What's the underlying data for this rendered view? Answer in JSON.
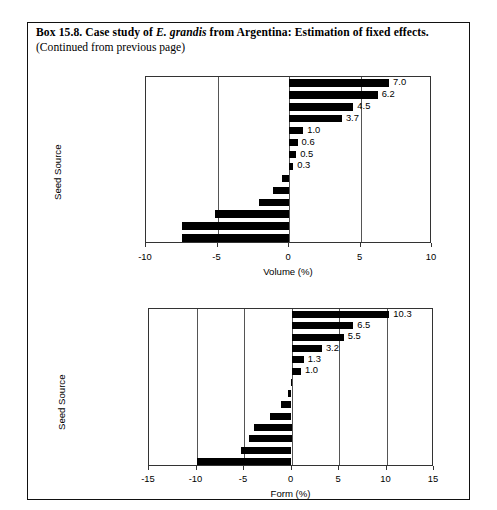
{
  "box": {
    "title_parts": {
      "before": "Box 15.8. Case study of ",
      "italic": "E. grandis",
      "after": " from Argentina: Estimation of fixed effects."
    },
    "title_full": "Box 15.8. Case study of E. grandis from Argentina: Estimation of fixed effects.",
    "subtitle": "(Continued from previous page)"
  },
  "chart_data": [
    {
      "id": "volume",
      "type": "bar",
      "orientation": "horizontal",
      "title": "",
      "xlabel": "Volume (%)",
      "ylabel": "Seed Source",
      "xlim": [
        -10,
        10
      ],
      "xticks": [
        -10,
        -5,
        0,
        5,
        10
      ],
      "xtick_labels": [
        "-10",
        "-5",
        "0",
        "5",
        "10"
      ],
      "grid": true,
      "gridlines_at": [
        -5,
        0,
        5
      ],
      "legend": null,
      "categories": [
        "N10",
        "N04",
        "N08",
        "N02",
        "N01",
        "Selected",
        "N12",
        "N11",
        "N03",
        "N05",
        "N06",
        "N07",
        "N09",
        "Unselected"
      ],
      "values": [
        7.0,
        6.2,
        4.5,
        3.7,
        1.0,
        0.6,
        0.5,
        0.3,
        -0.5,
        -1.1,
        -2.1,
        -5.2,
        -7.5,
        -7.5
      ],
      "value_labels": [
        "7.0",
        "6.2",
        "4.5",
        "3.7",
        "1.0",
        "0.6",
        "0.5",
        "0.3",
        "-0.5",
        "-1.1",
        "-2.1",
        "-5.2",
        "-7.5",
        "-7.5"
      ]
    },
    {
      "id": "form",
      "type": "bar",
      "orientation": "horizontal",
      "title": "",
      "xlabel": "Form (%)",
      "ylabel": "Seed Source",
      "xlim": [
        -15,
        15
      ],
      "xticks": [
        -15,
        -10,
        -5,
        0,
        5,
        10,
        15
      ],
      "xtick_labels": [
        "-15",
        "-10",
        "-5",
        "0",
        "5",
        "10",
        "15"
      ],
      "grid": true,
      "gridlines_at": [
        -10,
        -5,
        0,
        5,
        10
      ],
      "legend": null,
      "categories": [
        "N11",
        "N03",
        "N10",
        "N09",
        "N08",
        "N04",
        "Selected",
        "N05",
        "N01",
        "N06",
        "N02",
        "N12",
        "N07",
        "Unselected"
      ],
      "values": [
        10.3,
        6.5,
        5.5,
        3.2,
        1.3,
        1.0,
        -0.1,
        -0.4,
        -1.1,
        -2.3,
        -4.0,
        -4.5,
        -5.3,
        -9.9
      ],
      "value_labels": [
        "10.3",
        "6.5",
        "5.5",
        "3.2",
        "1.3",
        "1.0",
        "-0.1",
        "-0.4",
        "-1.1",
        "-2.3",
        "-4.0",
        "-4.5",
        "-5.3",
        "-9.9"
      ]
    }
  ]
}
